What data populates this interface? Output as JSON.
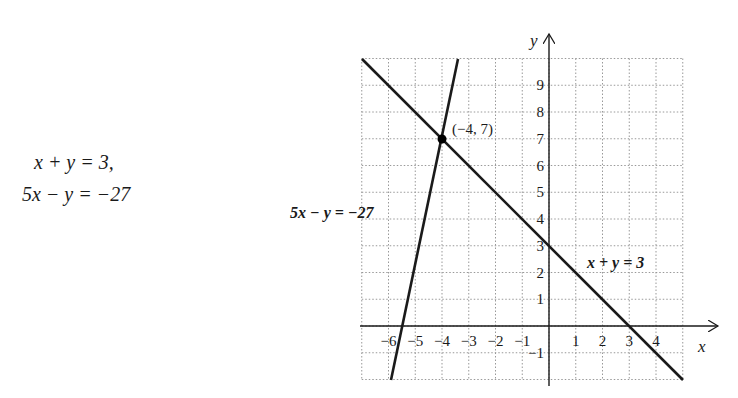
{
  "system": {
    "eq1": "x + y = 3,",
    "eq2": "5x − y = −27"
  },
  "chart_data": {
    "type": "line",
    "title": "",
    "xlabel": "x",
    "ylabel": "y",
    "xlim": [
      -7,
      5
    ],
    "ylim": [
      -2,
      10
    ],
    "grid": true,
    "x_tick_labels": [
      "−6",
      "−5",
      "−4",
      "−3",
      "−2",
      "−1",
      "1",
      "2",
      "3",
      "4"
    ],
    "y_tick_labels": [
      "−1",
      "1",
      "2",
      "3",
      "4",
      "5",
      "6",
      "7",
      "8",
      "9"
    ],
    "series": [
      {
        "name": "x + y = 3",
        "equation": "y = 3 - x",
        "x": [
          -7,
          5
        ],
        "y": [
          10,
          -2
        ]
      },
      {
        "name": "5x − y = −27",
        "equation": "y = 5x + 27",
        "x": [
          -5.8,
          -3.4
        ],
        "y": [
          -2,
          10
        ]
      }
    ],
    "annotations": [
      {
        "text": "(−4, 7)",
        "x": -4,
        "y": 7,
        "marker": "point"
      },
      {
        "text": "5x − y = −27",
        "position": "left of line"
      },
      {
        "text": "x + y = 3",
        "position": "right of line"
      }
    ]
  },
  "labels": {
    "point": "(−4, 7)",
    "line1": "x + y = 3",
    "line2": "5x − y = −27",
    "x_axis": "x",
    "y_axis": "y"
  }
}
